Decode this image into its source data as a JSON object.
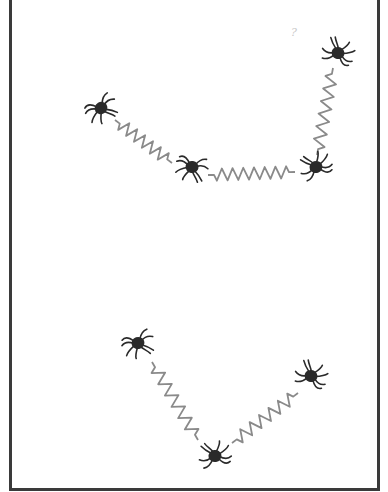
{
  "figure": {
    "background": "#ffffff",
    "border_color": "#3a3a3a",
    "spider_color": "#2a2a2a",
    "spring_color": "#8a8a8a",
    "corner_mark": "?"
  },
  "groups": [
    {
      "name": "upper-chain",
      "spiders": [
        {
          "id": "s1",
          "x": 101,
          "y": 108,
          "rot": -30
        },
        {
          "id": "s2",
          "x": 192,
          "y": 167,
          "rot": 10
        },
        {
          "id": "s3",
          "x": 316,
          "y": 167,
          "rot": 160
        },
        {
          "id": "s4",
          "x": 338,
          "y": 53,
          "rot": 200
        }
      ],
      "springs": [
        {
          "from": [
            115,
            120
          ],
          "to": [
            172,
            163
          ],
          "coils": 6
        },
        {
          "from": [
            208,
            175
          ],
          "to": [
            295,
            172
          ],
          "coils": 7
        },
        {
          "from": [
            317,
            155
          ],
          "to": [
            333,
            68
          ],
          "coils": 6
        }
      ]
    },
    {
      "name": "lower-chain",
      "spiders": [
        {
          "id": "s5",
          "x": 138,
          "y": 343,
          "rot": -20
        },
        {
          "id": "s6",
          "x": 215,
          "y": 456,
          "rot": 170
        },
        {
          "id": "s7",
          "x": 311,
          "y": 376,
          "rot": 200
        }
      ],
      "springs": [
        {
          "from": [
            152,
            362
          ],
          "to": [
            198,
            440
          ],
          "coils": 6
        },
        {
          "from": [
            232,
            443
          ],
          "to": [
            298,
            393
          ],
          "coils": 6
        }
      ]
    }
  ]
}
